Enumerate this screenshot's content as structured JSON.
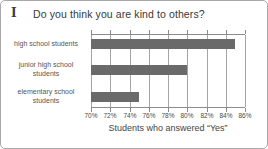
{
  "header": {
    "numeral": "I",
    "title": "Do you think you are kind to others?"
  },
  "chart_data": {
    "type": "bar",
    "orientation": "horizontal",
    "title": "Do you think you are kind to others?",
    "categories": [
      "high school students",
      "junior high school students",
      "elementary school students"
    ],
    "category_display_lines": [
      [
        "high school students"
      ],
      [
        "junior high school",
        "students"
      ],
      [
        "elementary school",
        "students"
      ]
    ],
    "values": [
      85,
      80,
      75
    ],
    "unit": "%",
    "xlabel": "Students who answered “Yes”",
    "xlim": [
      70,
      86
    ],
    "xticks": [
      70,
      72,
      74,
      76,
      78,
      80,
      82,
      84,
      86
    ],
    "xtick_labels": [
      "70%",
      "72%",
      "74%",
      "76%",
      "78%",
      "80%",
      "82%",
      "84%",
      "86%"
    ],
    "grid": true,
    "legend": false,
    "bar_color": "#6a6a6a",
    "gridline_color": "#a5a5a5",
    "axis_color": "#8c8c8c"
  }
}
